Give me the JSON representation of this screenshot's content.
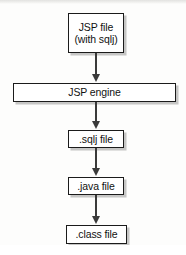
{
  "diagram": {
    "background_color": "#fdfdfc",
    "line_color": "#3a3a3a",
    "box_border_color": "#1b1b1b",
    "nodes": [
      {
        "id": "jsp-file",
        "line1": "JSP file",
        "line2": "(with sqlj)"
      },
      {
        "id": "jsp-engine",
        "line1": "JSP engine",
        "line2": ""
      },
      {
        "id": "sqlj-file",
        "line1": ".sqlj file",
        "line2": ""
      },
      {
        "id": "java-file",
        "line1": ".java file",
        "line2": ""
      },
      {
        "id": "class-file",
        "line1": ".class file",
        "line2": ""
      }
    ],
    "edges": [
      {
        "id": "jspfile-to-engine",
        "from": "jsp-file",
        "to": "jsp-engine",
        "arrowhead": "filled-triangle-down"
      },
      {
        "id": "engine-to-sqlj",
        "from": "jsp-engine",
        "to": "sqlj-file",
        "arrowhead": "filled-triangle-down"
      },
      {
        "id": "sqlj-to-java",
        "from": "sqlj-file",
        "to": "java-file",
        "arrowhead": "filled-triangle-down"
      },
      {
        "id": "java-to-class",
        "from": "java-file",
        "to": "class-file",
        "arrowhead": "filled-triangle-down"
      }
    ]
  }
}
